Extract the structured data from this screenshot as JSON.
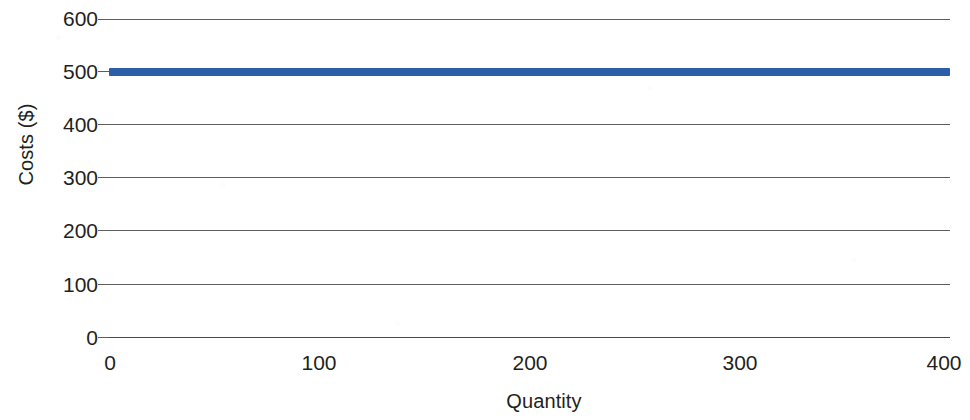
{
  "chart_data": {
    "type": "line",
    "title": "",
    "subtitle": "",
    "xlabel": "Quantity",
    "ylabel": "Costs ($)",
    "xlim": [
      0,
      400
    ],
    "ylim": [
      0,
      600
    ],
    "x_ticks": [
      0,
      100,
      200,
      300,
      400
    ],
    "x_tick_labels": [
      "0",
      "100",
      "200",
      "300",
      "400"
    ],
    "y_ticks": [
      0,
      100,
      200,
      300,
      400,
      500,
      600
    ],
    "y_tick_labels": [
      "0",
      "100",
      "200",
      "300",
      "400",
      "500",
      "600"
    ],
    "grid": true,
    "grid_axis": "y",
    "legend": false,
    "legend_position": "none",
    "annotations": [],
    "series": [
      {
        "name": "Fixed costs",
        "color": "#2b5ea6",
        "line_width": 8,
        "x": [
          0,
          100,
          200,
          300,
          400
        ],
        "values": [
          500,
          500,
          500,
          500,
          500
        ]
      }
    ],
    "colors": {
      "series_blue": "#2b5ea6",
      "gridline": "#5e5e5e",
      "axis": "#4a4a4a",
      "text": "#231f20",
      "background": "#ffffff"
    }
  }
}
